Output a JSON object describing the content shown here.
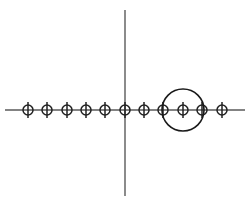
{
  "canvas": {
    "width": 251,
    "height": 205,
    "background_color": "#ffffff"
  },
  "colors": {
    "axis": "#5a5a5a",
    "node_stroke": "#222222",
    "big_circle_stroke": "#1a1a1a"
  },
  "chart_data": {
    "type": "scatter",
    "title": "",
    "subtitle": "",
    "xlabel": "",
    "ylabel": "",
    "grid": false,
    "legend": null,
    "annotations": [],
    "axes": {
      "horizontal": {
        "y": 110,
        "x_start": 5,
        "x_end": 245
      },
      "vertical": {
        "x": 125,
        "y_start": 10,
        "y_end": 196
      },
      "origin": {
        "x": 125,
        "y": 110
      }
    },
    "node_style": {
      "radius": 5,
      "tick_half_height": 8
    },
    "x": [
      28,
      47,
      67,
      86,
      105,
      125,
      144,
      163,
      183,
      202,
      222
    ],
    "y": [
      110,
      110,
      110,
      110,
      110,
      110,
      110,
      110,
      110,
      110,
      110
    ],
    "index_labels": [
      -5,
      -4,
      -3,
      -2,
      -1,
      0,
      1,
      2,
      3,
      4,
      5
    ],
    "node_count": 11,
    "node_spacing": 19.4,
    "big_circle": {
      "cx": 183,
      "cy": 110,
      "r": 21,
      "enclosed_node_indices": [
        7,
        8,
        9
      ]
    }
  }
}
